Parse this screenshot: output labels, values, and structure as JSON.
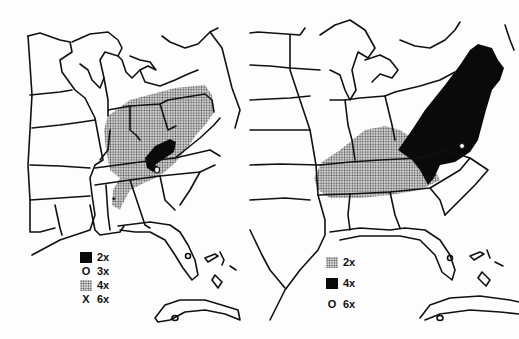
{
  "figure": {
    "type": "paired choropleth maps of the eastern United States",
    "colors": {
      "ink": "#111111",
      "background": "#fdfdfd",
      "stipple": "#888888"
    }
  },
  "left_map": {
    "legend": [
      {
        "symbol": "solid-black",
        "label": "2x"
      },
      {
        "symbol": "O",
        "label": "3x"
      },
      {
        "symbol": "stipple",
        "label": "4x"
      },
      {
        "symbol": "X",
        "label": "6x"
      }
    ],
    "regions": [
      {
        "pattern": "stipple",
        "value": "4x",
        "area": "Ohio Valley / Pennsylvania / Kentucky / Tennessee / NE Alabama"
      },
      {
        "pattern": "solid-black",
        "value": "2x",
        "area": "SW Virginia / E Kentucky / NE Tennessee"
      },
      {
        "pattern": "O",
        "value": "3x",
        "area": "W North Carolina"
      },
      {
        "pattern": "X",
        "value": "6x",
        "area": "Central Alabama"
      }
    ]
  },
  "right_map": {
    "legend": [
      {
        "symbol": "stipple",
        "label": "2x"
      },
      {
        "symbol": "solid-black",
        "label": "4x"
      },
      {
        "symbol": "O",
        "label": "6x"
      }
    ],
    "regions": [
      {
        "pattern": "stipple",
        "value": "2x",
        "area": "Kentucky / Tennessee / N Alabama / N Mississippi"
      },
      {
        "pattern": "solid-black",
        "value": "4x",
        "area": "Appalachians to New England"
      },
      {
        "pattern": "O",
        "value": "6x",
        "area": "Virginia"
      }
    ]
  }
}
